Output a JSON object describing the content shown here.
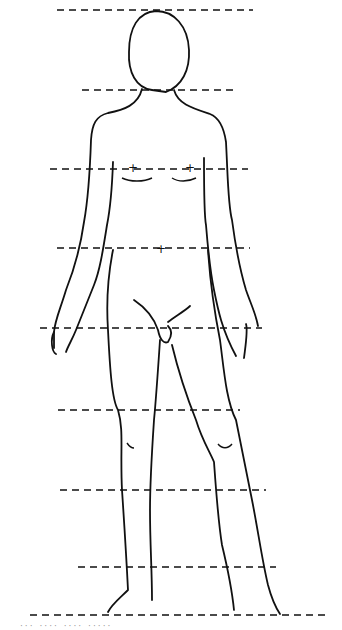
{
  "figure": {
    "guide_lines": [
      {
        "name": "top-of-head",
        "y": 10,
        "x1": 57,
        "x2": 253
      },
      {
        "name": "chin",
        "y": 90,
        "x1": 82,
        "x2": 238
      },
      {
        "name": "nipples",
        "y": 169,
        "x1": 50,
        "x2": 248
      },
      {
        "name": "navel",
        "y": 248,
        "x1": 57,
        "x2": 250
      },
      {
        "name": "crotch",
        "y": 328,
        "x1": 40,
        "x2": 262
      },
      {
        "name": "mid-thigh",
        "y": 410,
        "x1": 58,
        "x2": 240
      },
      {
        "name": "below-knee",
        "y": 490,
        "x1": 60,
        "x2": 266
      },
      {
        "name": "mid-calf",
        "y": 567,
        "x1": 78,
        "x2": 276
      },
      {
        "name": "soles",
        "y": 615,
        "x1": 30,
        "x2": 330
      }
    ],
    "units": 8,
    "caption": "··· ···· ···· ·····"
  },
  "colors": {
    "line": "#111111",
    "background": "#ffffff"
  }
}
